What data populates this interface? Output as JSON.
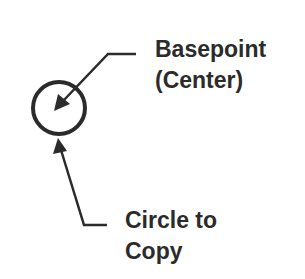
{
  "diagram": {
    "labels": {
      "basepoint": {
        "line1": "Basepoint",
        "line2": "(Center)"
      },
      "circle": {
        "line1": "Circle to",
        "line2": "Copy"
      }
    },
    "colors": {
      "stroke": "#2b2b2b",
      "text": "#2b2b2b",
      "background": "#ffffff"
    }
  }
}
